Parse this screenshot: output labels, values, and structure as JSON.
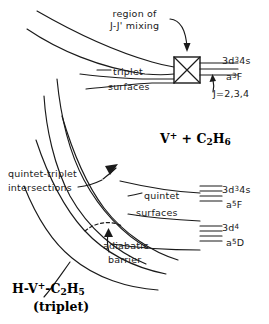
{
  "figure": {
    "type": "potential-energy-surface-correlation-diagram",
    "background_color": "#ffffff",
    "line_color": "#1a1a1a"
  },
  "annotations": {
    "region_line1": "region of",
    "region_line2": "J-J' mixing",
    "triplet_label": "triplet",
    "triplet_surfaces_word": "surfaces",
    "quintet_label": "quintet",
    "quintet_surfaces_word": "surfaces",
    "intersections_line1": "quintet-triplet",
    "intersections_line2": "intersections",
    "barrier_line1": "adiabatic",
    "barrier_line2": "barrier"
  },
  "levels": {
    "triplet": {
      "configuration": "3d34s",
      "config_base": "3d",
      "config_sup": "3",
      "config_tail": "4s",
      "term_prefix": "a",
      "term_sup": "3",
      "term_letter": "F",
      "j_values": "J=2,3,4"
    },
    "quintet_f": {
      "config_base": "3d",
      "config_sup": "3",
      "config_tail": "4s",
      "term_prefix": "a",
      "term_sup": "5",
      "term_letter": "F"
    },
    "quintet_d": {
      "config_base": "3d",
      "config_sup": "4",
      "config_tail": "",
      "term_prefix": "a",
      "term_sup": "5",
      "term_letter": "D"
    }
  },
  "asymptotes": {
    "reactants_prefix": "V",
    "reactants_charge": "+",
    "reactants_plus": " + C",
    "reactants_sub1": "2",
    "reactants_h": "H",
    "reactants_sub2": "6",
    "products_h": "H-V",
    "products_charge": "+",
    "products_dash_c": "-C",
    "products_sub1": "2",
    "products_h2": "H",
    "products_sub2": "5",
    "products_state": "(triplet)"
  }
}
